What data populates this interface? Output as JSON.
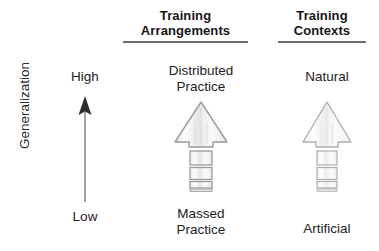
{
  "figure": {
    "type": "conceptual-diagram",
    "background": "#ffffff"
  },
  "axis": {
    "title": "Generalization",
    "high_label": "High",
    "low_label": "Low",
    "direction": "up",
    "arrow_color": "#3c3c3c",
    "shaft_color": "#8c8c8c"
  },
  "columns": [
    {
      "id": "training-arrangements",
      "header": "Training Arrangements",
      "header_line1": "Training",
      "header_line2": "Arrangements",
      "top_caption": "Distributed Practice",
      "top_caption_line1": "Distributed",
      "top_caption_line2": "Practice",
      "bottom_caption": "Massed Practice",
      "bottom_caption_line1": "Massed",
      "bottom_caption_line2": "Practice"
    },
    {
      "id": "training-contexts",
      "header": "Training Contexts",
      "header_line1": "Training",
      "header_line2": "Contexts",
      "top_caption": "Natural",
      "bottom_caption": "Artificial"
    }
  ],
  "arrow_style": {
    "fill": "#f2f2f2",
    "stroke": "#9a9a9a",
    "hatch": "#d8d8d8",
    "segments": 4,
    "segment_note": "stacked rectangles decreasing in height toward the bottom"
  },
  "colors": {
    "text": "#222222",
    "header_text": "#161616",
    "rule": "#6e6e6e"
  }
}
